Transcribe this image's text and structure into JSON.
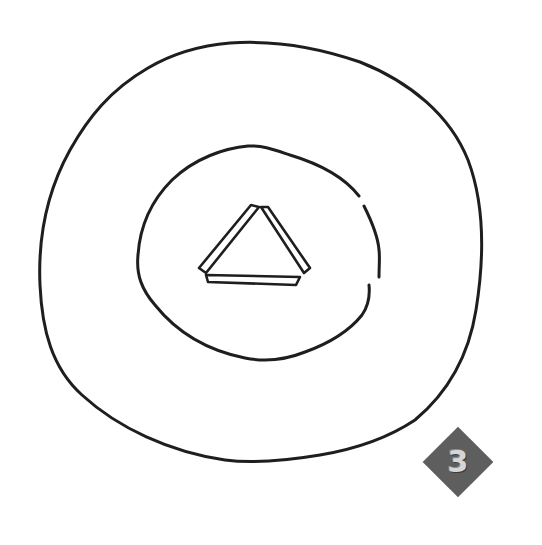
{
  "figure": {
    "background_color": "#ffffff",
    "stroke_color": "#1e1e1e",
    "shapes": [
      {
        "name": "outer-circle",
        "type": "hand-drawn circle",
        "closed": true
      },
      {
        "name": "inner-circle",
        "type": "hand-drawn circle",
        "closed": false,
        "gap": "right side"
      },
      {
        "name": "center-triangle",
        "type": "triangle of three separate double-line bars"
      }
    ],
    "badge": {
      "label": "3",
      "shape": "diamond",
      "fill_color": "#5e5e5e",
      "text_color": "#d6d6d6"
    }
  }
}
